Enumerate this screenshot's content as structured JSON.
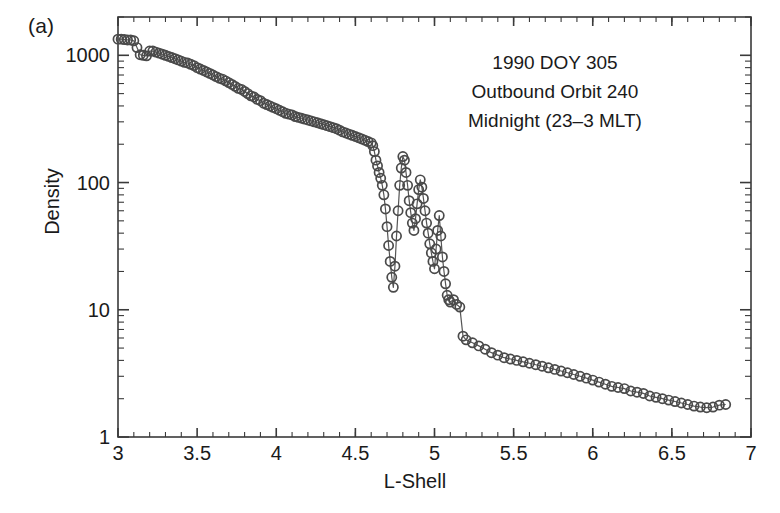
{
  "figure": {
    "panel_label": "(a)",
    "annotation_lines": [
      "1990 DOY 305",
      "Outbound Orbit 240",
      "Midnight (23–3 MLT)"
    ],
    "marker_color": "#4a4a4a",
    "line_color": "#555555",
    "axis_color": "#3a3a3a",
    "background": "#ffffff"
  },
  "chart_data": {
    "type": "scatter",
    "title": "",
    "subtitle": "",
    "xlabel": "L-Shell",
    "ylabel": "Density",
    "xlim": [
      3,
      7
    ],
    "ylim": [
      1,
      2000
    ],
    "yscale": "log",
    "xscale": "linear",
    "grid": false,
    "legend": null,
    "annotations": [
      "(a)",
      "1990 DOY 305",
      "Outbound Orbit 240",
      "Midnight (23–3 MLT)"
    ],
    "xticks": [
      3,
      3.5,
      4,
      4.5,
      5,
      5.5,
      6,
      6.5,
      7
    ],
    "xticklabels": [
      "3",
      "3.5",
      "4",
      "4.5",
      "5",
      "5.5",
      "6",
      "6.5",
      "7"
    ],
    "yticks": [
      1,
      10,
      100,
      1000
    ],
    "yticklabels": [
      "1",
      "10",
      "100",
      "1000"
    ],
    "minor_ticks": true,
    "marker": "open-circle",
    "connected": true,
    "series": [
      {
        "name": "Density",
        "x": [
          3.0,
          3.02,
          3.04,
          3.06,
          3.08,
          3.1,
          3.12,
          3.14,
          3.16,
          3.18,
          3.2,
          3.22,
          3.24,
          3.26,
          3.28,
          3.3,
          3.32,
          3.34,
          3.36,
          3.38,
          3.4,
          3.42,
          3.44,
          3.46,
          3.48,
          3.5,
          3.52,
          3.54,
          3.56,
          3.58,
          3.6,
          3.62,
          3.64,
          3.66,
          3.68,
          3.7,
          3.72,
          3.74,
          3.76,
          3.78,
          3.8,
          3.82,
          3.84,
          3.86,
          3.88,
          3.9,
          3.92,
          3.94,
          3.96,
          3.98,
          4.0,
          4.02,
          4.04,
          4.06,
          4.08,
          4.1,
          4.12,
          4.14,
          4.16,
          4.18,
          4.2,
          4.22,
          4.24,
          4.26,
          4.28,
          4.3,
          4.32,
          4.34,
          4.36,
          4.38,
          4.4,
          4.42,
          4.44,
          4.46,
          4.48,
          4.5,
          4.52,
          4.54,
          4.56,
          4.58,
          4.6,
          4.61,
          4.62,
          4.63,
          4.64,
          4.65,
          4.66,
          4.67,
          4.68,
          4.69,
          4.7,
          4.71,
          4.72,
          4.73,
          4.74,
          4.75,
          4.76,
          4.77,
          4.78,
          4.79,
          4.8,
          4.81,
          4.82,
          4.83,
          4.84,
          4.85,
          4.86,
          4.87,
          4.88,
          4.89,
          4.9,
          4.91,
          4.92,
          4.93,
          4.94,
          4.95,
          4.96,
          4.97,
          4.98,
          4.99,
          5.0,
          5.01,
          5.02,
          5.03,
          5.04,
          5.05,
          5.06,
          5.07,
          5.08,
          5.09,
          5.1,
          5.12,
          5.14,
          5.16,
          5.18,
          5.2,
          5.24,
          5.28,
          5.32,
          5.36,
          5.4,
          5.44,
          5.48,
          5.52,
          5.56,
          5.6,
          5.64,
          5.68,
          5.72,
          5.76,
          5.8,
          5.84,
          5.88,
          5.92,
          5.96,
          6.0,
          6.04,
          6.08,
          6.12,
          6.16,
          6.2,
          6.24,
          6.28,
          6.32,
          6.36,
          6.4,
          6.44,
          6.48,
          6.52,
          6.56,
          6.6,
          6.64,
          6.68,
          6.72,
          6.76,
          6.8,
          6.84
        ],
        "y": [
          1340,
          1340,
          1330,
          1320,
          1320,
          1300,
          1150,
          1010,
          1000,
          990,
          1080,
          1080,
          1060,
          1040,
          1020,
          1000,
          980,
          960,
          940,
          920,
          900,
          880,
          870,
          850,
          830,
          800,
          780,
          760,
          740,
          720,
          700,
          680,
          660,
          650,
          630,
          610,
          590,
          570,
          550,
          540,
          520,
          500,
          480,
          470,
          450,
          440,
          420,
          410,
          400,
          390,
          380,
          370,
          360,
          350,
          345,
          340,
          330,
          325,
          320,
          315,
          310,
          305,
          300,
          295,
          290,
          285,
          280,
          275,
          270,
          265,
          258,
          250,
          245,
          240,
          235,
          230,
          225,
          220,
          215,
          210,
          205,
          195,
          175,
          150,
          135,
          120,
          108,
          95,
          80,
          62,
          45,
          32,
          24,
          18,
          15,
          22,
          38,
          60,
          95,
          130,
          160,
          150,
          120,
          95,
          72,
          58,
          48,
          42,
          52,
          68,
          88,
          105,
          92,
          75,
          60,
          48,
          40,
          33,
          28,
          24,
          21,
          30,
          42,
          55,
          38,
          26,
          20,
          16,
          13,
          12,
          11.5,
          12,
          11,
          10.5,
          6.2,
          5.8,
          5.5,
          5.2,
          4.9,
          4.6,
          4.4,
          4.2,
          4.1,
          4.0,
          3.9,
          3.8,
          3.7,
          3.6,
          3.5,
          3.4,
          3.3,
          3.2,
          3.1,
          3.0,
          2.9,
          2.8,
          2.7,
          2.6,
          2.5,
          2.45,
          2.4,
          2.3,
          2.25,
          2.2,
          2.1,
          2.05,
          2.0,
          1.95,
          1.9,
          1.85,
          1.8,
          1.75,
          1.72,
          1.7,
          1.72,
          1.78,
          1.8
        ]
      }
    ]
  },
  "axes_geometry": {
    "left": 118,
    "right": 751,
    "top": 17,
    "bottom": 437
  }
}
